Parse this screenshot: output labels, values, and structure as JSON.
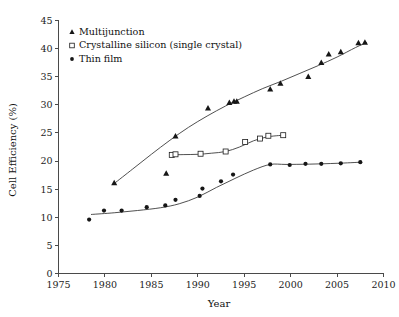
{
  "chart_data": {
    "type": "scatter",
    "title": "",
    "xlabel": "Year",
    "ylabel": "Cell Efficiency (%)",
    "xlim": [
      1975,
      2010
    ],
    "ylim": [
      0,
      45
    ],
    "xticks": [
      1975,
      1980,
      1985,
      1990,
      1995,
      2000,
      2005,
      2010
    ],
    "yticks": [
      0,
      5,
      10,
      15,
      20,
      25,
      30,
      35,
      40,
      45
    ],
    "xtick_labels": [
      "1975",
      "1980",
      "1985",
      "1990",
      "1995",
      "2000",
      "2005",
      "2010"
    ],
    "ytick_labels": [
      "0",
      "5",
      "10",
      "15",
      "20",
      "25",
      "30",
      "35",
      "40",
      "45"
    ],
    "grid": false,
    "legend_position": "top-left",
    "series": [
      {
        "name": "Multijunction",
        "marker": "filled-triangle",
        "color": "#161616",
        "x": [
          1981.0,
          1986.6,
          1987.6,
          1991.1,
          1993.4,
          1993.9,
          1994.2,
          1997.8,
          1998.9,
          2001.9,
          2003.3,
          2004.1,
          2005.4,
          2007.3,
          2008.0
        ],
        "y": [
          16.1,
          17.8,
          24.4,
          29.4,
          30.4,
          30.6,
          30.6,
          32.8,
          33.8,
          35.0,
          37.5,
          39.0,
          39.4,
          41.0,
          41.1
        ],
        "trend_x": [
          1981.0,
          1983.0,
          1985.0,
          1987.0,
          1989.0,
          1991.0,
          1993.0,
          1995.0,
          1997.0,
          1999.0,
          2001.0,
          2003.0,
          2005.0,
          2007.0,
          2008.2
        ],
        "trend_y": [
          16.0,
          18.6,
          21.2,
          23.7,
          26.0,
          28.0,
          29.8,
          31.4,
          32.9,
          34.2,
          35.6,
          37.0,
          38.5,
          40.2,
          41.1
        ]
      },
      {
        "name": "Crystalline silicon (single crystal)",
        "marker": "open-square",
        "color": "#1c1c1c",
        "x": [
          1987.2,
          1987.6,
          1990.3,
          1993.0,
          1995.1,
          1996.7,
          1997.6,
          1999.2
        ],
        "y": [
          21.1,
          21.2,
          21.3,
          21.7,
          23.4,
          24.0,
          24.5,
          24.6
        ],
        "trend_x": [
          1987.0,
          1988.5,
          1990.0,
          1991.5,
          1993.0,
          1994.5,
          1996.0,
          1997.5,
          1999.2
        ],
        "trend_y": [
          21.1,
          21.15,
          21.2,
          21.4,
          21.7,
          22.5,
          23.6,
          24.3,
          24.6
        ]
      },
      {
        "name": "Thin film",
        "marker": "filled-circle",
        "color": "#161616",
        "x": [
          1978.3,
          1979.9,
          1981.8,
          1984.5,
          1986.5,
          1987.6,
          1990.2,
          1990.5,
          1992.5,
          1993.8,
          1997.8,
          1999.9,
          2001.6,
          2003.3,
          2005.4,
          2007.5
        ],
        "y": [
          9.6,
          11.2,
          11.2,
          11.8,
          12.1,
          13.1,
          13.8,
          15.1,
          16.4,
          17.6,
          19.4,
          19.3,
          19.5,
          19.5,
          19.6,
          19.8
        ],
        "trend_x": [
          1978.5,
          1981.0,
          1983.5,
          1986.0,
          1988.0,
          1990.0,
          1992.0,
          1994.0,
          1996.0,
          1997.8,
          1999.5,
          2002.0,
          2005.0,
          2007.6
        ],
        "trend_y": [
          10.5,
          10.8,
          11.2,
          11.7,
          12.4,
          13.6,
          15.3,
          16.9,
          18.4,
          19.4,
          19.4,
          19.45,
          19.6,
          19.8
        ]
      }
    ]
  },
  "legend": {
    "items": [
      {
        "label": "Multijunction",
        "marker": "filled-triangle"
      },
      {
        "label": "Crystalline silicon (single crystal)",
        "marker": "open-square"
      },
      {
        "label": "Thin film",
        "marker": "filled-circle"
      }
    ]
  },
  "axes": {
    "x_title": "Year",
    "y_title": "Cell Efficiency (%)"
  }
}
